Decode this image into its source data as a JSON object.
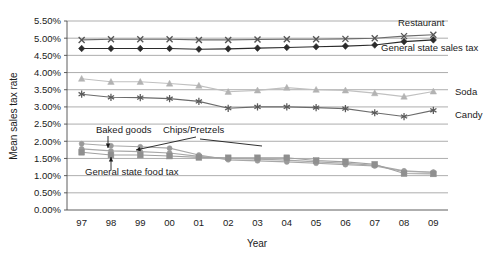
{
  "chart_data": {
    "type": "line",
    "title": "",
    "xlabel": "Year",
    "ylabel": "Mean sales tax rate",
    "x": [
      "97",
      "98",
      "99",
      "00",
      "01",
      "02",
      "03",
      "04",
      "05",
      "06",
      "07",
      "08",
      "09"
    ],
    "xtick_labels": [
      "97",
      "98",
      "99",
      "00",
      "01",
      "02",
      "03",
      "04",
      "05",
      "06",
      "07",
      "08",
      "09"
    ],
    "ytick_labels": [
      "0.00%",
      "0.50%",
      "1.00%",
      "1.50%",
      "2.00%",
      "2.50%",
      "3.00%",
      "3.50%",
      "4.00%",
      "4.50%",
      "5.00%",
      "5.50%"
    ],
    "ytick_values": [
      0.0,
      0.5,
      1.0,
      1.5,
      2.0,
      2.5,
      3.0,
      3.5,
      4.0,
      4.5,
      5.0,
      5.5
    ],
    "ylim": [
      0.0,
      5.5
    ],
    "grid": true,
    "grid_axis": "y",
    "legend": "inline-right-and-annotations",
    "units": "percent",
    "series": [
      {
        "name": "Restaurant",
        "marker": "x-cross",
        "color": "#555555",
        "line_color": "#6b6b6b",
        "label_position": "right-inline",
        "values": [
          4.95,
          4.97,
          4.97,
          4.97,
          4.95,
          4.95,
          4.96,
          4.97,
          4.97,
          4.98,
          5.0,
          5.06,
          5.1
        ]
      },
      {
        "name": "General state sales tax",
        "marker": "diamond-filled",
        "color": "#2b2b2b",
        "line_color": "#2b2b2b",
        "label_position": "right-inline",
        "values": [
          4.7,
          4.7,
          4.7,
          4.7,
          4.68,
          4.69,
          4.71,
          4.73,
          4.75,
          4.77,
          4.8,
          4.9,
          4.95
        ]
      },
      {
        "name": "Soda",
        "marker": "triangle-up",
        "color": "#b3b3b3",
        "line_color": "#c0c0c0",
        "label_position": "right-inline",
        "values": [
          3.82,
          3.73,
          3.73,
          3.68,
          3.62,
          3.44,
          3.48,
          3.56,
          3.5,
          3.48,
          3.4,
          3.3,
          3.45
        ]
      },
      {
        "name": "Candy",
        "marker": "asterisk",
        "color": "#5a5a5a",
        "line_color": "#6b6b6b",
        "label_position": "right-inline",
        "values": [
          3.37,
          3.28,
          3.27,
          3.24,
          3.16,
          2.96,
          3.0,
          3.0,
          2.98,
          2.95,
          2.83,
          2.72,
          2.9
        ]
      },
      {
        "name": "Baked goods",
        "marker": "circle-light",
        "color": "#9a9a9a",
        "line_color": "#a8a8a8",
        "label_position": "annotation",
        "values": [
          1.93,
          1.87,
          1.84,
          1.8,
          1.6,
          1.46,
          1.43,
          1.4,
          1.36,
          1.32,
          1.28,
          1.12,
          1.1
        ]
      },
      {
        "name": "Chips/Pretzels",
        "marker": "circle-light",
        "color": "#9a9a9a",
        "line_color": "#a8a8a8",
        "label_position": "annotation",
        "values": [
          1.78,
          1.72,
          1.7,
          1.66,
          1.56,
          1.5,
          1.48,
          1.45,
          1.4,
          1.36,
          1.3,
          1.14,
          1.1
        ]
      },
      {
        "name": "General state food tax",
        "marker": "square",
        "color": "#8f8f8f",
        "line_color": "#a0a0a0",
        "label_position": "annotation",
        "values": [
          1.68,
          1.6,
          1.6,
          1.57,
          1.53,
          1.52,
          1.52,
          1.52,
          1.44,
          1.4,
          1.33,
          1.06,
          1.05
        ]
      }
    ],
    "annotations": [
      {
        "text": "Baked goods",
        "label_x": 96,
        "label_y": 133,
        "arrow_from_x": 108,
        "arrow_from_y": 136,
        "arrow_to_x": 108,
        "arrow_to_y": 148
      },
      {
        "text": "Chips/Pretzels",
        "label_x": 163,
        "label_y": 133,
        "arrow_from_x": 196,
        "arrow_from_y": 137,
        "arrow_to_x": 136,
        "arrow_to_y": 150
      },
      {
        "text": "General state food tax",
        "label_x": 85,
        "label_y": 175,
        "arrow_from_x": 111,
        "arrow_from_y": 170,
        "arrow_to_x": 111,
        "arrow_to_y": 157
      }
    ],
    "inline_labels": [
      {
        "text": "Restaurant",
        "x": 398,
        "y": 26
      },
      {
        "text": "General state sales tax",
        "x": 381,
        "y": 51
      },
      {
        "text": "Soda",
        "x": 455,
        "y": 95
      },
      {
        "text": "Candy",
        "x": 455,
        "y": 118
      }
    ]
  },
  "layout": {
    "plot_left": 67,
    "plot_right": 448,
    "plot_top": 21,
    "plot_bottom": 210,
    "extra_chips_arrow": {
      "from_x": 200,
      "from_y": 139,
      "to_x": 262,
      "to_y": 146
    }
  }
}
